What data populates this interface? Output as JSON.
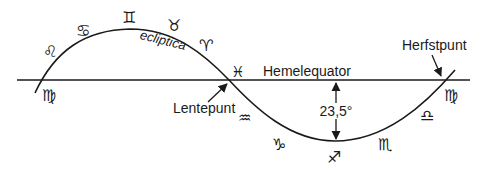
{
  "diagram": {
    "labels": {
      "ecliptic": "ecliptica",
      "celestial_equator": "Hemelequator",
      "vernal_point": "Lentepunt",
      "autumn_point": "Herfstpunt",
      "obliquity": "23,5°"
    },
    "zodiac": {
      "virgo_left": "♍",
      "leo": "♌",
      "cancer": "♋",
      "gemini": "♊",
      "taurus": "♉",
      "aries": "♈",
      "pisces": "♓",
      "aquarius": "♒",
      "capricorn": "♑",
      "sagittarius": "♐",
      "scorpio": "♏",
      "libra": "♎",
      "virgo_right": "♍"
    },
    "colors": {
      "line": "#1a1a1a",
      "background": "#ffffff"
    }
  }
}
